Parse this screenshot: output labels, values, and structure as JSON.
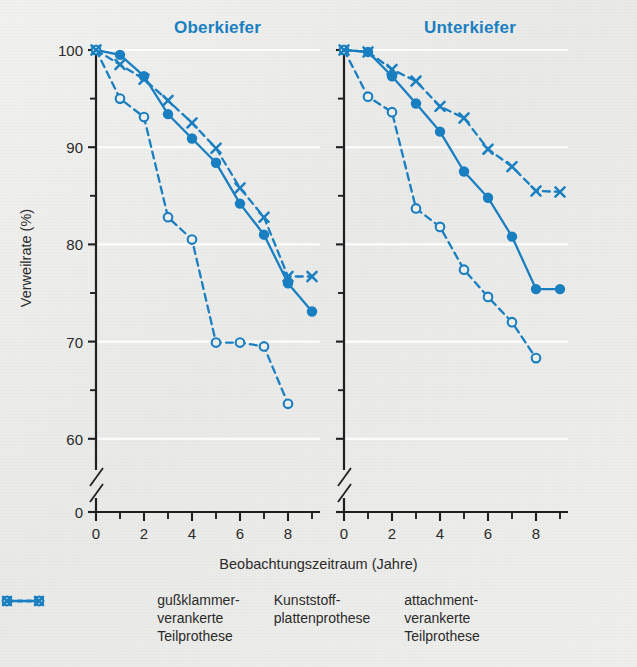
{
  "chart_data": {
    "type": "line",
    "title": "",
    "xlabel": "Beobachtungszeitraum (Jahre)",
    "ylabel": "Verweilrate (%)",
    "xlim": [
      0,
      9.3
    ],
    "ylim": [
      57,
      101
    ],
    "yticks": [
      60,
      70,
      80,
      90,
      100
    ],
    "yticks_minor": [
      65,
      75,
      85,
      95
    ],
    "axis_break_label": "0",
    "xticks": [
      0,
      2,
      4,
      6,
      8
    ],
    "xticks_minor": [
      1,
      3,
      5,
      7,
      9
    ],
    "grid": "horizontal-white-at-major-y",
    "legend_position": "bottom",
    "panels": [
      {
        "name": "Oberkiefer",
        "title": "Oberkiefer",
        "series": [
          {
            "name": "gußklammer-verankerte Teilprothese",
            "marker": "filled-circle",
            "linestyle": "solid",
            "color": "#1a7fc1",
            "x": [
              0,
              1,
              2,
              3,
              4,
              5,
              6,
              7,
              8,
              9
            ],
            "y": [
              100,
              99.5,
              97.3,
              93.4,
              90.9,
              88.4,
              84.2,
              81.0,
              76.0,
              73.1
            ]
          },
          {
            "name": "Kunststoff-plattenprothese",
            "marker": "open-circle",
            "linestyle": "dashed",
            "color": "#1a7fc1",
            "x": [
              0,
              1,
              2,
              3,
              4,
              5,
              6,
              7,
              8
            ],
            "y": [
              100,
              95.0,
              93.1,
              82.8,
              80.5,
              69.9,
              69.9,
              69.5,
              63.6
            ]
          },
          {
            "name": "attachment-verankerte Teilprothese",
            "marker": "cross",
            "linestyle": "dashed",
            "color": "#1a7fc1",
            "x": [
              0,
              1,
              2,
              3,
              4,
              5,
              6,
              7,
              8,
              9
            ],
            "y": [
              100,
              98.5,
              97.0,
              94.8,
              92.5,
              89.9,
              85.8,
              82.8,
              76.7,
              76.7
            ]
          }
        ]
      },
      {
        "name": "Unterkiefer",
        "title": "Unterkiefer",
        "series": [
          {
            "name": "gußklammer-verankerte Teilprothese",
            "marker": "filled-circle",
            "linestyle": "solid",
            "color": "#1a7fc1",
            "x": [
              0,
              1,
              2,
              3,
              4,
              5,
              6,
              7,
              8,
              9
            ],
            "y": [
              100,
              99.8,
              97.3,
              94.5,
              91.6,
              87.5,
              84.8,
              80.8,
              75.4,
              75.4
            ]
          },
          {
            "name": "Kunststoff-plattenprothese",
            "marker": "open-circle",
            "linestyle": "dashed",
            "color": "#1a7fc1",
            "x": [
              0,
              1,
              2,
              3,
              4,
              5,
              6,
              7,
              8
            ],
            "y": [
              100,
              95.2,
              93.6,
              83.7,
              81.8,
              77.4,
              74.6,
              72.0,
              68.3
            ]
          },
          {
            "name": "attachment-verankerte Teilprothese",
            "marker": "cross",
            "linestyle": "dashed",
            "color": "#1a7fc1",
            "x": [
              0,
              1,
              2,
              3,
              4,
              5,
              6,
              7,
              8,
              9
            ],
            "y": [
              100,
              99.8,
              98.0,
              96.8,
              94.2,
              93.0,
              89.8,
              88.0,
              85.5,
              85.4
            ]
          }
        ]
      }
    ]
  },
  "panels": {
    "left_title": "Oberkiefer",
    "right_title": "Unterkiefer"
  },
  "axes": {
    "ylabel": "Verweilrate (%)",
    "xlabel": "Beobachtungszeitraum (Jahre)",
    "ytick_100": "100",
    "ytick_90": "90",
    "ytick_80": "80",
    "ytick_70": "70",
    "ytick_60": "60",
    "ytick_0": "0",
    "xtick_0": "0",
    "xtick_2": "2",
    "xtick_4": "4",
    "xtick_6": "6",
    "xtick_8": "8"
  },
  "legend": {
    "items": [
      {
        "symbol": "filled-circle-solid-line",
        "label": "gußklammer-\nverankerte\nTeilprothese"
      },
      {
        "symbol": "open-circle-dashed-line",
        "label": "Kunststoff-\nplattenprothese"
      },
      {
        "symbol": "cross-dashed-line",
        "label": "attachment-\nverankerte\nTeilprothese"
      }
    ]
  },
  "colors": {
    "accent": "#1a7fc1",
    "axis": "#231f20",
    "text": "#2b2b2b",
    "background": "#eeeeec",
    "gridline": "#ffffff"
  }
}
